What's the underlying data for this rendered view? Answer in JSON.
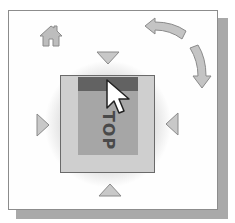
{
  "widget": {
    "type": "viewcube",
    "cube": {
      "face_label": "TOP",
      "hover_edge": "top"
    },
    "controls": {
      "home": {
        "icon": "home-icon"
      },
      "rotate_ccw": {
        "icon": "curved-arrow-left-icon"
      },
      "rotate_cw": {
        "icon": "curved-arrow-down-icon"
      },
      "arrow_up": {
        "icon": "triangle-down-icon"
      },
      "arrow_down": {
        "icon": "triangle-up-icon"
      },
      "arrow_left": {
        "icon": "triangle-right-icon"
      },
      "arrow_right": {
        "icon": "triangle-left-icon"
      }
    },
    "cursor": {
      "icon": "mouse-pointer-icon"
    },
    "colors": {
      "frame_border": "#8c8c8c",
      "shadow": "#a9a9a9",
      "cube_outer": "#cfcfcf",
      "cube_face": "#a6a6a6",
      "highlight_band": "#626262",
      "arrow_fill": "#c8c8c8",
      "arrow_stroke": "#8a8a8a"
    }
  }
}
